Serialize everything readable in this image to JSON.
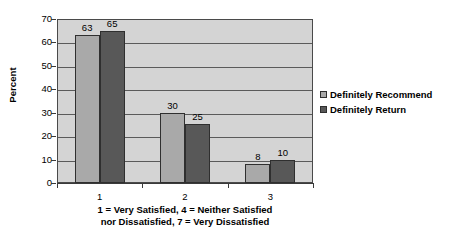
{
  "chart_data": {
    "type": "bar",
    "title": "",
    "xlabel": "1 = Very Satisfied, 4 = Neither Satisfied nor Dissatisfied, 7 = Very Dissatisfied",
    "xlabel_line1": "1 = Very Satisfied, 4 = Neither Satisfied",
    "xlabel_line2": "nor Dissatisfied, 7 = Very Dissatisfied",
    "ylabel": "Percent",
    "categories": [
      "1",
      "2",
      "3"
    ],
    "series": [
      {
        "name": "Definitely Recommend",
        "values": [
          63,
          30,
          8
        ],
        "color": "#a9a9a9"
      },
      {
        "name": "Definitely Return",
        "values": [
          65,
          25,
          10
        ],
        "color": "#585858"
      }
    ],
    "ylim": [
      0,
      70
    ],
    "yticks": [
      0,
      10,
      20,
      30,
      40,
      50,
      60,
      70
    ],
    "ytick_labels": [
      "0",
      "10",
      "20",
      "30",
      "40",
      "50",
      "60",
      "70"
    ],
    "grid": "horizontal",
    "legend_position": "right",
    "plot_background": "#d4d4d4",
    "data_labels": true
  },
  "legend": {
    "items": [
      {
        "label": "Definitely Recommend"
      },
      {
        "label": "Definitely Return"
      }
    ]
  }
}
